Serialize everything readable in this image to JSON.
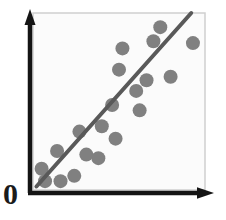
{
  "chart_data": {
    "type": "scatter",
    "title": "",
    "subtitle": "",
    "xlabel": "",
    "ylabel": "",
    "origin_label": "0",
    "grid": false,
    "legend": null,
    "axis_style": "arrow-axes",
    "xlim": [
      0,
      100
    ],
    "ylim": [
      0,
      100
    ],
    "x_tick_labels": [],
    "y_tick_labels": [],
    "correlation": "positive",
    "point_color": "#808080",
    "line_color": "#595959",
    "axis_color": "#141414",
    "frame_color": "#cfcfcf",
    "plot_background": "#fbfbfb",
    "point_radius_px": 7,
    "points": [
      {
        "x": 5,
        "y": 12
      },
      {
        "x": 7,
        "y": 5
      },
      {
        "x": 14,
        "y": 22
      },
      {
        "x": 16,
        "y": 5
      },
      {
        "x": 24,
        "y": 8
      },
      {
        "x": 27,
        "y": 33
      },
      {
        "x": 31,
        "y": 20
      },
      {
        "x": 38,
        "y": 18
      },
      {
        "x": 40,
        "y": 36
      },
      {
        "x": 46,
        "y": 48
      },
      {
        "x": 48,
        "y": 29
      },
      {
        "x": 50,
        "y": 68
      },
      {
        "x": 52,
        "y": 80
      },
      {
        "x": 60,
        "y": 56
      },
      {
        "x": 62,
        "y": 45
      },
      {
        "x": 66,
        "y": 62
      },
      {
        "x": 70,
        "y": 84
      },
      {
        "x": 74,
        "y": 92
      },
      {
        "x": 80,
        "y": 64
      },
      {
        "x": 93,
        "y": 83
      }
    ],
    "trend_line": {
      "label": "",
      "x0": 2,
      "y0": 2,
      "x1": 92,
      "y1": 100,
      "width_px": 4
    }
  },
  "figure": {
    "origin_label": "0"
  }
}
